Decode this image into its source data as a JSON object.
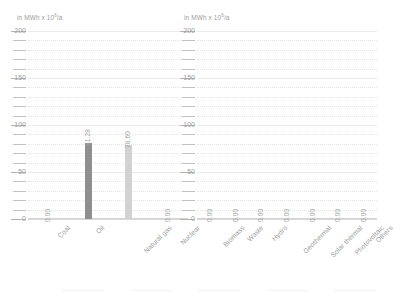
{
  "chart_data": [
    {
      "type": "bar",
      "panel": "left",
      "title": "in MWh x 10⁶/a",
      "unit_prefix": "in MWh x 10",
      "unit_exponent": "6",
      "unit_suffix": "/a",
      "xlabel": "",
      "ylabel": "in MWh x 10⁶/a",
      "ylim": [
        0,
        200
      ],
      "yticks": [
        0,
        50,
        100,
        150,
        200
      ],
      "ytick_labels": [
        "0",
        "50",
        "100",
        "150",
        "200"
      ],
      "minor_tick_step": 10,
      "grid": true,
      "legend": "none",
      "categories": [
        "Coal",
        "Oil",
        "Natural gas",
        "Nuclear"
      ],
      "values": [
        0.0,
        81.28,
        78.6,
        0.0
      ],
      "value_labels": [
        "0.00",
        "81.28",
        "78.60",
        "0.00"
      ],
      "bar_colors": [
        "#8f8f8f",
        "#8f8f8f",
        "#d2d2d2",
        "#d2d2d2"
      ]
    },
    {
      "type": "bar",
      "panel": "right",
      "title": "in MWh x 10⁶/a",
      "unit_prefix": "in MWh x 10",
      "unit_exponent": "6",
      "unit_suffix": "/a",
      "xlabel": "",
      "ylabel": "in MWh x 10⁶/a",
      "ylim": [
        0,
        200
      ],
      "yticks": [
        0,
        50,
        100,
        150,
        200
      ],
      "ytick_labels": [
        "0",
        "50",
        "100",
        "150",
        "200"
      ],
      "minor_tick_step": 10,
      "grid": true,
      "legend": "none",
      "categories": [
        "Biomass",
        "Waste",
        "Hydro",
        "Geothermal",
        "Solar thermal",
        "Photovoltaic",
        "Others"
      ],
      "values": [
        0.0,
        0.0,
        0.0,
        0.0,
        0.0,
        0.0,
        0.0
      ],
      "value_labels": [
        "0.00",
        "0.00",
        "0.00",
        "0.00",
        "0.00",
        "0.00",
        "0.00"
      ],
      "bar_colors": [
        "#d2d2d2",
        "#d2d2d2",
        "#d2d2d2",
        "#d2d2d2",
        "#d2d2d2",
        "#d2d2d2",
        "#d2d2d2"
      ]
    }
  ],
  "colors": {
    "background": "#ffffff",
    "text": "#9d9d9d",
    "grid": "#e4e4e4",
    "axis": "#d4d4d4",
    "bar_dark": "#8f8f8f",
    "bar_light": "#d2d2d2"
  }
}
